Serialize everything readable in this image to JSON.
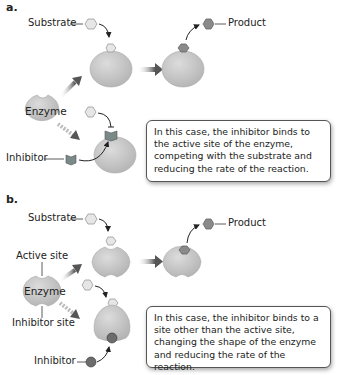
{
  "panels": [
    {
      "label": "a.",
      "substrate_label": "Substrate",
      "product_label": "Product",
      "enzyme_label": "Enzyme",
      "inhibitor_label": "Inhibitor",
      "callout": "In this case, the inhibitor binds to the active site of the enzyme, competing with the substrate and reducing the rate of the reaction."
    },
    {
      "label": "b.",
      "substrate_label": "Substrate",
      "product_label": "Product",
      "enzyme_label": "Enzyme",
      "active_site_label": "Active site",
      "inhibitor_site_label": "Inhibitor site",
      "inhibitor_label": "Inhibitor",
      "callout": "In this case, the inhibitor binds to a site other than the active site, changing the shape of the enzyme and reducing the rate of the reaction."
    }
  ],
  "colors": {
    "enzyme": "#c9c9c9",
    "substrate": "#e6e6e6",
    "product": "#8a8a8a",
    "arrow": "#6e6e6e"
  }
}
